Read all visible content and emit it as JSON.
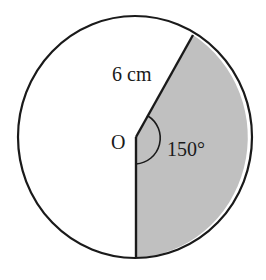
{
  "diagram": {
    "type": "circle-sector",
    "center_label": "O",
    "radius_label": "6 cm",
    "angle_label": "150°",
    "colors": {
      "stroke": "#1a1a1a",
      "sector_fill": "#c0c0c0",
      "background": "#ffffff"
    }
  }
}
